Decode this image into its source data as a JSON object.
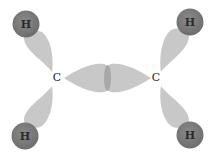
{
  "diagram": {
    "type": "molecular-orbital",
    "atoms": {
      "carbon_left": {
        "label": "C",
        "x": 57,
        "y": 77
      },
      "carbon_right": {
        "label": "C",
        "x": 156,
        "y": 77
      },
      "hydrogen_top_left": {
        "label": "H",
        "x": 26,
        "y": 24
      },
      "hydrogen_top_right": {
        "label": "H",
        "x": 190,
        "y": 22
      },
      "hydrogen_bottom_left": {
        "label": "H",
        "x": 25,
        "y": 136
      },
      "hydrogen_bottom_right": {
        "label": "H",
        "x": 190,
        "y": 135
      }
    },
    "colors": {
      "lobe": "#c8c8c8",
      "overlap": "#a8a8a8",
      "hydrogen": "#7a7a7a",
      "hydrogen_label": "#2a2a2a",
      "carbon_label": "#222222"
    }
  }
}
